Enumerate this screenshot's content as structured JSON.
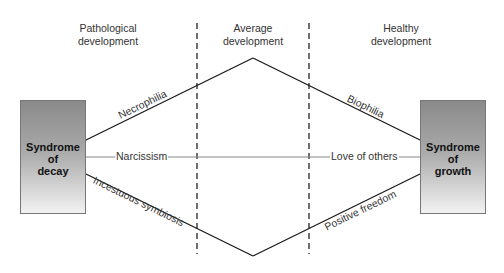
{
  "diagram": {
    "headers": {
      "left": "Pathological\ndevelopment",
      "middle": "Average\ndevelopment",
      "right": "Healthy\ndevelopment"
    },
    "boxes": {
      "left": "Syndrome\nof\ndecay",
      "right": "Syndrome\nof\ngrowth"
    },
    "edges": {
      "necrophilia": "Necrophilia",
      "biophilia": "Biophilia",
      "narcissism": "Narcissism",
      "love_of_others": "Love of others",
      "incestuous_symbiosis": "Incestuous symbiosis",
      "positive_freedom": "Positive freedom"
    },
    "colors": {
      "line": "#1a1a1a",
      "middle_line": "#888888",
      "dashed": "#222222",
      "box_top": "#8a8a8a",
      "box_bottom": "#f2f2f2"
    }
  }
}
